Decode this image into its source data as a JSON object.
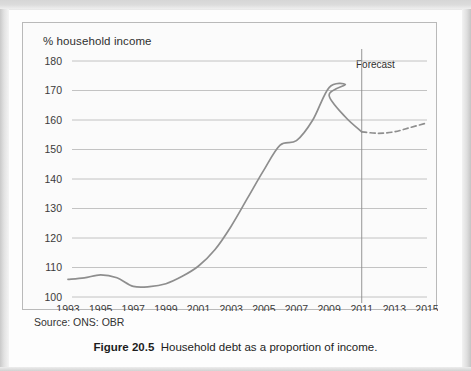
{
  "figure": {
    "caption_number": "Figure 20.5",
    "caption_text": "Household debt as a proportion of income.",
    "source": "Source: ONS: OBR"
  },
  "chart_data": {
    "type": "line",
    "title": "",
    "ylabel": "% household income",
    "xlabel": "",
    "ylim": [
      100,
      180
    ],
    "xlim": [
      1993,
      2015
    ],
    "yticks": [
      100,
      110,
      120,
      130,
      140,
      150,
      160,
      170,
      180
    ],
    "xticks": [
      1993,
      1995,
      1997,
      1999,
      2001,
      2003,
      2005,
      2007,
      2009,
      2011,
      2013,
      2015
    ],
    "grid": "horizontal",
    "legend": "none",
    "annotations": [
      {
        "text": "Forecast",
        "x": 2011,
        "type": "vertical-divider-label"
      }
    ],
    "series": [
      {
        "name": "Household debt (actual)",
        "style": "solid",
        "color": "#8e8e8e",
        "x": [
          1993,
          1994,
          1995,
          1996,
          1997,
          1998,
          1999,
          2000,
          2001,
          2002,
          2003,
          2004,
          2005,
          2006,
          2007,
          2008,
          2009,
          2010,
          2011
        ],
        "values": [
          106,
          106.5,
          107.5,
          106.5,
          103.6,
          103.5,
          104.5,
          107,
          110.5,
          116,
          124,
          133.5,
          143,
          151.5,
          153,
          160,
          171,
          172,
          168.5
        ]
      },
      {
        "name": "Household debt (forecast)",
        "style": "dashed",
        "color": "#8e8e8e",
        "x": [
          2011,
          2012,
          2013,
          2014,
          2015
        ],
        "values": [
          156,
          155.5,
          156,
          157.5,
          159
        ]
      }
    ],
    "actual_tail": {
      "note": "solid series continues descending through 2009-2011",
      "x": [
        2009,
        2010,
        2011
      ],
      "values": [
        168.5,
        161,
        156
      ]
    }
  }
}
